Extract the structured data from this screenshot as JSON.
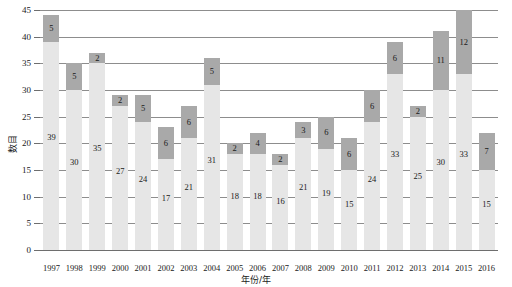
{
  "chart_data": {
    "type": "bar",
    "stacked": true,
    "title": "",
    "xlabel": "年份/年",
    "ylabel": "数目",
    "ylim": [
      0,
      45
    ],
    "ytick_step": 5,
    "yticks": [
      0,
      5,
      10,
      15,
      20,
      25,
      30,
      35,
      40,
      45
    ],
    "grid": true,
    "legend": "none",
    "categories": [
      "1997",
      "1998",
      "1999",
      "2000",
      "2001",
      "2002",
      "2003",
      "2004",
      "2005",
      "2006",
      "2007",
      "2008",
      "2009",
      "2010",
      "2011",
      "2012",
      "2013",
      "2014",
      "2015",
      "2016"
    ],
    "series": [
      {
        "name": "light",
        "color": "#e6e6e6",
        "values": [
          39,
          30,
          35,
          27,
          24,
          17,
          21,
          31,
          18,
          18,
          16,
          21,
          19,
          15,
          24,
          33,
          25,
          30,
          33,
          15
        ]
      },
      {
        "name": "dark",
        "color": "#a9a9a9",
        "values": [
          5,
          5,
          2,
          2,
          5,
          6,
          6,
          5,
          2,
          4,
          2,
          3,
          6,
          6,
          6,
          6,
          2,
          11,
          12,
          7
        ]
      }
    ],
    "totals": [
      44,
      35,
      37,
      29,
      29,
      23,
      27,
      36,
      20,
      22,
      18,
      24,
      25,
      21,
      30,
      39,
      27,
      41,
      45,
      22
    ]
  },
  "colors": {
    "light_bar": "#e6e6e6",
    "dark_bar": "#a9a9a9",
    "gridline": "#8d8d8d",
    "axis": "#6e6e6e",
    "text": "#1a1a1a",
    "background": "#ffffff"
  }
}
